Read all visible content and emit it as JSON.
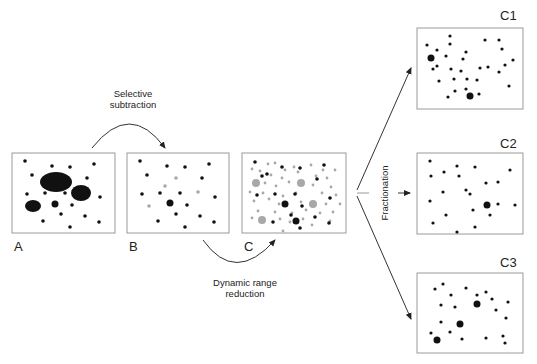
{
  "panels": {
    "A": {
      "label": "A"
    },
    "B": {
      "label": "B"
    },
    "C": {
      "label": "C"
    },
    "C1": {
      "label": "C1"
    },
    "C2": {
      "label": "C2"
    },
    "C3": {
      "label": "C3"
    }
  },
  "steps": {
    "selective_subtraction": {
      "line1": "Selective",
      "line2": "subtraction"
    },
    "dynamic_range_reduction": {
      "line1": "Dynamic range",
      "line2": "reduction"
    },
    "fractionation": {
      "label": "Fractionation"
    }
  },
  "colors": {
    "frame": "#9a9a9a",
    "dot": "#111111",
    "grey_dot": "#a8a8a8",
    "arrow": "#333333"
  }
}
